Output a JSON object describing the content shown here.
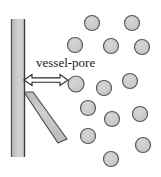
{
  "figure": {
    "type": "schematic-diagram",
    "width": 161,
    "height": 177,
    "background_color": "#ffffff",
    "label": {
      "text": "vessel-pore",
      "x": 36,
      "y": 56,
      "font_size": 13,
      "color": "#1a1a1a"
    },
    "colors": {
      "wall_fill": "#c4c4c4",
      "wall_fill_light": "#d8d8d8",
      "wall_stroke": "#4a4a4a",
      "branch_fill": "#c0c0c0",
      "branch_stroke": "#4a4a4a",
      "particle_fill": "#cacaca",
      "particle_stroke": "#555555",
      "arrow_fill": "#ffffff",
      "arrow_stroke": "#2a2a2a",
      "text": "#1a1a1a"
    },
    "vessel_wall": {
      "name": "vessel-wall",
      "x": 11,
      "y": 19,
      "width": 14,
      "height": 138
    },
    "branch_wall": {
      "name": "branch-wall",
      "points": "24,92 33,92 66,138 58,142",
      "description": "diagonal branch extending down-right from the vessel wall"
    },
    "arrow": {
      "name": "vessel-pore-arrow",
      "description": "double-headed horizontal arrow measuring the pore gap",
      "x_start": 24,
      "x_end": 68,
      "y": 80,
      "head_size": 7,
      "shaft_half_height": 2.5
    },
    "particles": [
      {
        "id": 1,
        "cx": 92,
        "cy": 23,
        "r": 7.5
      },
      {
        "id": 2,
        "cx": 132,
        "cy": 23,
        "r": 7.5
      },
      {
        "id": 3,
        "cx": 75,
        "cy": 45,
        "r": 7.5
      },
      {
        "id": 4,
        "cx": 111,
        "cy": 46,
        "r": 7.5
      },
      {
        "id": 5,
        "cx": 142,
        "cy": 47,
        "r": 7.5
      },
      {
        "id": 6,
        "cx": 76,
        "cy": 84,
        "r": 8.0
      },
      {
        "id": 7,
        "cx": 104,
        "cy": 88,
        "r": 7.5
      },
      {
        "id": 8,
        "cx": 130,
        "cy": 81,
        "r": 7.5
      },
      {
        "id": 9,
        "cx": 88,
        "cy": 108,
        "r": 7.5
      },
      {
        "id": 10,
        "cx": 112,
        "cy": 119,
        "r": 7.5
      },
      {
        "id": 11,
        "cx": 140,
        "cy": 114,
        "r": 7.5
      },
      {
        "id": 12,
        "cx": 88,
        "cy": 136,
        "r": 7.5
      },
      {
        "id": 13,
        "cx": 143,
        "cy": 145,
        "r": 7.5
      },
      {
        "id": 14,
        "cx": 111,
        "cy": 159,
        "r": 7.5
      }
    ]
  }
}
